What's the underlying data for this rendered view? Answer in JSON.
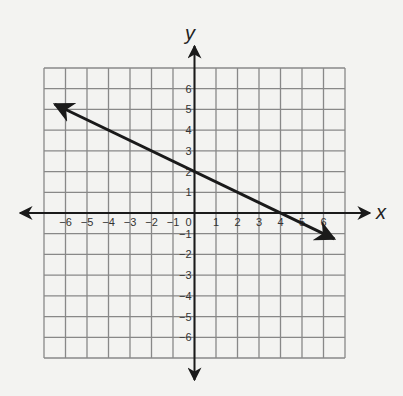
{
  "chart_data": {
    "type": "line",
    "title": "",
    "xlabel": "x",
    "ylabel": "y",
    "xlim": [
      -7,
      7
    ],
    "ylim": [
      -7,
      7
    ],
    "grid": true,
    "x_ticks": [
      -6,
      -5,
      -4,
      -3,
      -2,
      -1,
      0,
      1,
      2,
      3,
      4,
      5,
      6
    ],
    "y_ticks": [
      6,
      5,
      4,
      3,
      2,
      1,
      -1,
      -2,
      -3,
      -4,
      -5,
      -6
    ],
    "series": [
      {
        "name": "line",
        "equation": "y = -1/2 x + 2",
        "slope": -0.5,
        "y_intercept": 2,
        "x_intercept": 4,
        "x": [
          -6.5,
          0,
          4,
          6.5
        ],
        "y": [
          5.25,
          2,
          0,
          -1.25
        ],
        "arrows_both_ends": true,
        "color": "#1a1a1a"
      }
    ]
  },
  "colors": {
    "background": "#f3f3f1",
    "grid": "#888888",
    "axis": "#1a1a1a",
    "line": "#1a1a1a"
  }
}
